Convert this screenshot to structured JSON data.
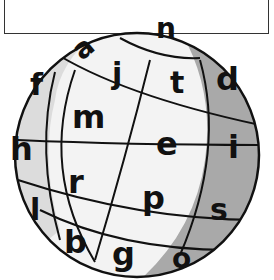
{
  "caption": {
    "text": "You can turn it any way you like."
  },
  "globe": {
    "colors": {
      "light": "#f3f3f3",
      "mid": "#dcdcdc",
      "dark": "#a9a9a9",
      "outline": "#111111"
    },
    "letters": [
      {
        "id": "a",
        "char": "a"
      },
      {
        "id": "n",
        "char": "n"
      },
      {
        "id": "j",
        "char": "j"
      },
      {
        "id": "t",
        "char": "t"
      },
      {
        "id": "d",
        "char": "d"
      },
      {
        "id": "f",
        "char": "f"
      },
      {
        "id": "m",
        "char": "m"
      },
      {
        "id": "e",
        "char": "e"
      },
      {
        "id": "i",
        "char": "i"
      },
      {
        "id": "h",
        "char": "h"
      },
      {
        "id": "r",
        "char": "r"
      },
      {
        "id": "p",
        "char": "p"
      },
      {
        "id": "s",
        "char": "s"
      },
      {
        "id": "l",
        "char": "l"
      },
      {
        "id": "b",
        "char": "b"
      },
      {
        "id": "g",
        "char": "g"
      },
      {
        "id": "o",
        "char": "o"
      }
    ]
  }
}
